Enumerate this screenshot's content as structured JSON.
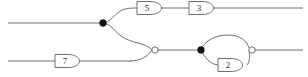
{
  "diagram": {
    "type": "logic-circuit",
    "title": "",
    "background_color": "#ffffff",
    "wire_color": "#6e6e6e",
    "junction_color": "#111111",
    "label_color": "#2a2a2a",
    "gates": [
      {
        "id": "gate-5",
        "label": "5",
        "shape": "buffer-d-shape",
        "x": 137,
        "y": 8,
        "width": 26,
        "height": 13
      },
      {
        "id": "gate-3",
        "label": "3",
        "shape": "buffer-d-shape",
        "x": 189,
        "y": 8,
        "width": 26,
        "height": 13
      },
      {
        "id": "gate-7",
        "label": "7",
        "shape": "buffer-d-shape",
        "x": 55,
        "y": 61,
        "width": 26,
        "height": 13
      },
      {
        "id": "gate-2",
        "label": "2",
        "shape": "buffer-d-shape",
        "x": 222,
        "y": 65,
        "width": 26,
        "height": 13
      }
    ],
    "gate_bodies": [
      {
        "id": "nor-gate-left",
        "kind": "nor",
        "inverted": true,
        "bubble_x": 155,
        "bubble_y": 50,
        "bubble_r": 3.2
      },
      {
        "id": "nor-gate-right",
        "kind": "nor",
        "inverted": true,
        "bubble_x": 252,
        "bubble_y": 50,
        "bubble_r": 3.2
      }
    ],
    "junctions": [
      {
        "id": "junction-top",
        "x": 103,
        "y": 23,
        "r": 3.4
      },
      {
        "id": "junction-right",
        "x": 201,
        "y": 50,
        "r": 3.4
      }
    ],
    "wires": [
      {
        "id": "wire-input-top",
        "from_x": 8,
        "from_y": 23,
        "to_x": 103,
        "to_y": 23
      },
      {
        "id": "wire-gate5-to-gate3",
        "from_x": 163,
        "from_y": 8,
        "to_x": 189,
        "to_y": 8
      },
      {
        "id": "wire-gate3-output",
        "from_x": 215,
        "from_y": 8,
        "to_x": 302,
        "to_y": 8
      },
      {
        "id": "wire-input-bottom",
        "from_x": 8,
        "from_y": 61,
        "to_x": 55,
        "to_y": 61
      },
      {
        "id": "wire-gate7-output",
        "from_x": 81,
        "from_y": 61,
        "to_x": 130,
        "to_y": 61
      },
      {
        "id": "wire-nor-left-output",
        "from_x": 158,
        "from_y": 50,
        "to_x": 201,
        "to_y": 50
      },
      {
        "id": "wire-nor-right-output",
        "from_x": 255,
        "from_y": 50,
        "to_x": 302,
        "to_y": 50
      }
    ]
  }
}
